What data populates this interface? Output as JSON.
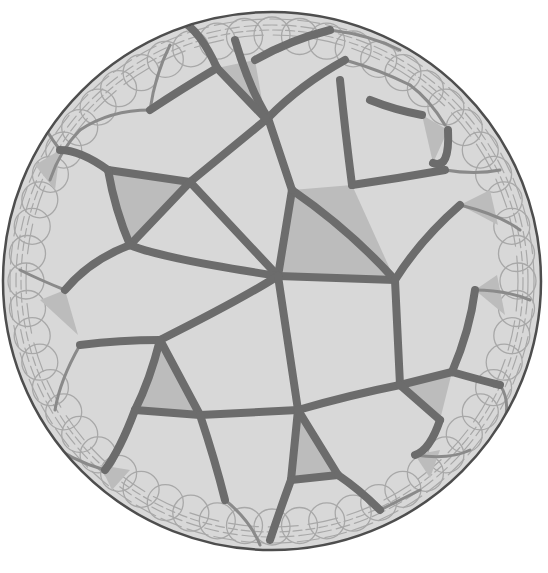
{
  "figure": {
    "title": "",
    "caption": "",
    "colors": {
      "background": "#ffffff",
      "face": "#d8d8d8",
      "shaded_triangle": "#bcbcbc",
      "edge": "#6c6c6c",
      "edge_thin": "#8a8a8a",
      "edge_faint": "#a8a8a8",
      "rim": "#4e4e4e"
    },
    "disk": {
      "cx": 272,
      "cy": 281,
      "r": 269
    }
  },
  "tiling": {
    "shaded_triangles": [
      {
        "id": "center",
        "points": "292,190 352,185 395,280 278,276"
      },
      {
        "id": "upper-left",
        "points": "108,170 190,182 130,245"
      },
      {
        "id": "lower-left",
        "points": "160,340 200,415 135,410"
      },
      {
        "id": "bottom",
        "points": "298,410 338,475 291,480"
      },
      {
        "id": "lower-right",
        "points": "400,385 452,372 440,420"
      },
      {
        "id": "top",
        "points": "217,68 255,60 265,118"
      },
      {
        "id": "upper-right",
        "points": "422,115 448,130 433,163"
      },
      {
        "id": "right-upper",
        "points": "460,205 490,190 498,225"
      },
      {
        "id": "right-lower",
        "points": "475,290 497,275 505,315"
      },
      {
        "id": "left-mid",
        "points": "40,300 65,290 78,335"
      },
      {
        "id": "left-upper",
        "points": "35,165 60,150 55,190"
      },
      {
        "id": "bottom-left",
        "points": "100,465 130,470 112,490"
      },
      {
        "id": "bottom-right",
        "points": "415,455 440,450 430,478"
      }
    ],
    "major_edges": [
      "M292,190 L278,276",
      "M278,276 L395,280",
      "M292,190 Q350,230 395,280",
      "M292,190 L268,118",
      "M268,118 Q250,90 235,40",
      "M268,118 Q300,85 345,60",
      "M190,182 L268,118",
      "M190,182 L278,276",
      "M108,170 L190,182",
      "M108,170 Q115,210 130,245",
      "M130,245 L190,182",
      "M130,245 Q160,258 278,276",
      "M278,276 Q240,300 160,340",
      "M278,276 L298,410",
      "M395,280 L400,385",
      "M395,280 Q420,240 460,205",
      "M352,185 Q400,178 445,170",
      "M352,185 Q345,130 340,80",
      "M160,340 L200,415",
      "M160,340 Q120,340 80,345",
      "M160,340 Q150,380 135,410",
      "M135,410 L200,415",
      "M200,415 L298,410",
      "M298,410 L291,480",
      "M298,410 Q350,395 400,385",
      "M298,410 L338,475",
      "M291,480 L338,475",
      "M400,385 L452,372",
      "M400,385 L440,420",
      "M452,372 Q470,330 475,290",
      "M108,170 Q80,150 60,150",
      "M130,245 Q90,260 65,290",
      "M217,68 Q200,30 180,20",
      "M217,68 L265,118",
      "M217,68 Q180,90 150,110",
      "M255,60 Q290,40 330,30",
      "M448,130 Q450,170 433,163",
      "M422,115 Q395,110 370,100",
      "M135,410 Q120,450 105,470",
      "M200,415 Q215,460 225,500",
      "M338,475 Q360,490 380,510",
      "M291,480 Q280,510 270,540",
      "M440,420 Q430,450 415,455",
      "M452,372 Q480,380 500,385"
    ],
    "secondary_arcs": [
      "M150,110 Q110,110 80,130",
      "M150,110 Q155,75 170,45",
      "M80,130 Q60,150 50,180",
      "M345,60 Q380,70 410,85",
      "M410,85 Q430,100 445,125",
      "M445,170 Q475,175 500,170",
      "M460,205 Q500,215 520,230",
      "M475,290 Q505,290 530,300",
      "M80,345 Q60,380 55,410",
      "M105,470 Q70,460 45,440",
      "M225,500 Q250,520 260,545",
      "M380,510 Q400,500 420,490",
      "M415,455 Q450,460 470,450",
      "M500,385 Q510,400 505,420",
      "M65,290 Q40,280 20,270",
      "M60,150 Q45,130 35,110",
      "M180,20 Q140,35 110,55",
      "M330,30 Q370,35 400,50"
    ],
    "rim_rings": [
      {
        "r": 262,
        "dash": "22 6"
      },
      {
        "r": 256,
        "dash": "14 5"
      },
      {
        "r": 251,
        "dash": "9 4"
      },
      {
        "r": 246,
        "dash": "30 10"
      }
    ]
  }
}
